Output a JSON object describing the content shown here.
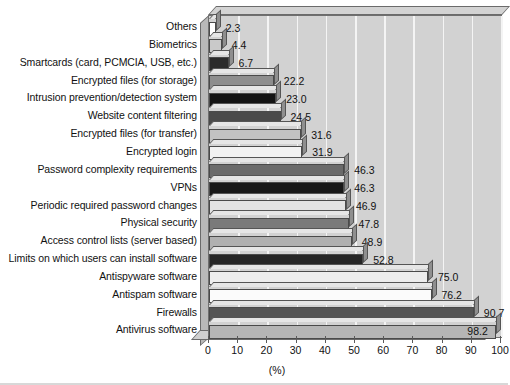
{
  "chart_data": {
    "type": "bar",
    "orientation": "horizontal",
    "title": "",
    "subtitle": "",
    "xlabel": "(%)",
    "ylabel": "",
    "xlim": [
      0,
      100
    ],
    "ylim": null,
    "grid": true,
    "legend": false,
    "xticks": [
      "0",
      "10",
      "20",
      "30",
      "40",
      "50",
      "60",
      "70",
      "80",
      "90",
      "100"
    ],
    "categories": [
      "Others",
      "Biometrics",
      "Smartcards (card, PCMCIA, USB, etc.)",
      "Encrypted files (for storage)",
      "Intrusion prevention/detection system",
      "Website content filtering",
      "Encrypted files (for transfer)",
      "Encrypted login",
      "Password complexity requirements",
      "VPNs",
      "Periodic required password changes",
      "Physical security",
      "Access control lists (server based)",
      "Limits on which users can install software",
      "Antispyware software",
      "Antispam software",
      "Firewalls",
      "Antivirus software"
    ],
    "values": [
      2.3,
      4.4,
      6.7,
      22.2,
      23.0,
      24.5,
      31.6,
      31.9,
      46.3,
      46.3,
      46.9,
      47.8,
      48.9,
      52.8,
      75.0,
      76.2,
      90.7,
      98.2
    ],
    "value_labels": [
      "2.3",
      "4.4",
      "6.7",
      "22.2",
      "23.0",
      "24.5",
      "31.6",
      "31.9",
      "46.3",
      "46.3",
      "46.9",
      "47.8",
      "48.9",
      "52.8",
      "75.0",
      "76.2",
      "90.7",
      "98.2"
    ],
    "bar_colors": [
      "#ffffff",
      "#c9c9c9",
      "#2b2b2b",
      "#8e8e8e",
      "#141414",
      "#4a4a4a",
      "#c2c2c2",
      "#f2f2f2",
      "#6b6b6b",
      "#181818",
      "#e3e3e3",
      "#7a7a7a",
      "#b0b0b0",
      "#262626",
      "#ededed",
      "#fbfbfb",
      "#555555",
      "#b5b5b5"
    ],
    "label_placement": [
      "outside",
      "outside",
      "outside",
      "outside",
      "outside",
      "outside",
      "outside",
      "outside",
      "outside",
      "outside",
      "outside",
      "outside",
      "outside",
      "outside",
      "outside",
      "outside",
      "outside",
      "inside"
    ],
    "plot_background": "#d2d2d2",
    "gridline_color": "#f4f4f4",
    "page_background": "#ffffff"
  }
}
